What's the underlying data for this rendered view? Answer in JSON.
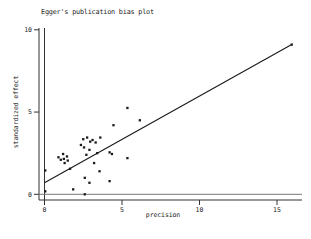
{
  "chart_data": {
    "type": "scatter",
    "title": "Egger's publication bias plot",
    "xlabel": "precision",
    "ylabel": "standardized effect",
    "xlim": [
      0,
      16.3
    ],
    "ylim": [
      -0.3,
      10
    ],
    "x_ticks": [
      "0",
      "5",
      "10",
      "15"
    ],
    "x_tick_values": [
      0,
      5,
      10,
      15
    ],
    "y_ticks": [
      "0",
      "5",
      "10"
    ],
    "y_tick_values": [
      0,
      5,
      10
    ],
    "grid": false,
    "legend": "none",
    "marker": "filled-square",
    "colors": {
      "points": "#1a1a1a",
      "regression_line": "#1a1a1a",
      "axis": "#333333",
      "zero_line": "#777777",
      "background": "#ffffff"
    },
    "points": [
      [
        0.05,
        1.45
      ],
      [
        0.05,
        0.18
      ],
      [
        0.9,
        2.25
      ],
      [
        1.05,
        2.1
      ],
      [
        1.2,
        2.45
      ],
      [
        1.25,
        2.15
      ],
      [
        1.45,
        2.3
      ],
      [
        1.5,
        2.05
      ],
      [
        1.3,
        1.9
      ],
      [
        1.65,
        1.55
      ],
      [
        1.85,
        0.3
      ],
      [
        2.35,
        3.0
      ],
      [
        2.5,
        3.35
      ],
      [
        2.55,
        2.85
      ],
      [
        2.75,
        3.45
      ],
      [
        2.95,
        3.2
      ],
      [
        3.1,
        3.3
      ],
      [
        3.3,
        3.15
      ],
      [
        3.6,
        3.45
      ],
      [
        2.9,
        2.7
      ],
      [
        3.4,
        2.5
      ],
      [
        2.7,
        2.4
      ],
      [
        3.2,
        1.9
      ],
      [
        3.55,
        1.4
      ],
      [
        2.6,
        1.0
      ],
      [
        2.9,
        0.7
      ],
      [
        2.6,
        0.0
      ],
      [
        4.2,
        0.8
      ],
      [
        4.2,
        2.55
      ],
      [
        4.35,
        2.45
      ],
      [
        5.35,
        2.2
      ],
      [
        4.45,
        4.2
      ],
      [
        6.15,
        4.5
      ],
      [
        5.35,
        5.25
      ],
      [
        15.95,
        9.1
      ]
    ],
    "regression_line": {
      "x_start": 0,
      "y_start": 0.7,
      "x_end": 15.95,
      "y_end": 9.1
    },
    "reference_line_y": 0
  }
}
